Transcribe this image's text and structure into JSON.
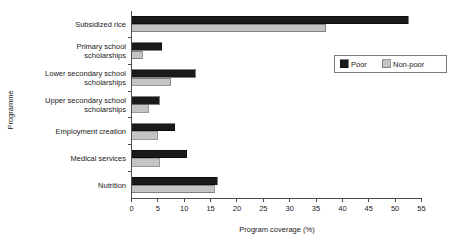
{
  "chart_data": {
    "type": "bar",
    "orientation": "horizontal",
    "title": "",
    "xlabel": "Program coverage (%)",
    "ylabel": "Programme",
    "xlim": [
      0,
      55
    ],
    "xticks": [
      "0",
      "5",
      "10",
      "15",
      "20",
      "25",
      "30",
      "35",
      "40",
      "45",
      "50",
      "55"
    ],
    "xtick_step": 5,
    "grid": false,
    "legend_position": "upper right",
    "categories": [
      "Subsidized rice",
      "Primary school scholarships",
      "Lower secondary school scholarships",
      "Upper secondary school scholarships",
      "Employment creation",
      "Medical services",
      "Nutrition"
    ],
    "category_lines": [
      [
        "Subsidized rice"
      ],
      [
        "Primary school",
        "scholarships"
      ],
      [
        "Lower secondary school",
        "scholarships"
      ],
      [
        "Upper secondary school",
        "scholarships"
      ],
      [
        "Employment creation"
      ],
      [
        "Medical services"
      ],
      [
        "Nutrition"
      ]
    ],
    "series": [
      {
        "name": "Poor",
        "color": "#1a1a1a",
        "values": [
          52.5,
          5.7,
          12.1,
          5.3,
          8.2,
          10.5,
          16.3
        ]
      },
      {
        "name": "Non-poor",
        "color": "#c4c4c4",
        "values": [
          36.8,
          2.0,
          7.4,
          3.2,
          4.9,
          5.3,
          15.7
        ]
      }
    ]
  },
  "legend": {
    "entries": [
      {
        "label": "Poor",
        "swatch": "swatch-poor-icon"
      },
      {
        "label": "Non-poor",
        "swatch": "swatch-nonpoor-icon"
      }
    ]
  },
  "axes": {
    "x_title": "Program coverage (%)",
    "y_title": "Programme"
  }
}
